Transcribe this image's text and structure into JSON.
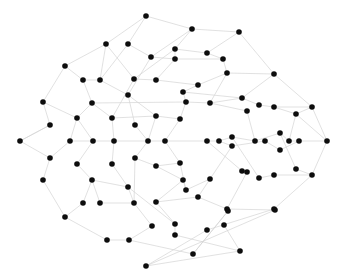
{
  "diagram": {
    "type": "network-graph",
    "node_color": "#0d0d0d",
    "edge_color": "#d4d4d4",
    "node_radius": 2.8,
    "nodes": [
      [
        146,
        16
      ],
      [
        192,
        29
      ],
      [
        239,
        32
      ],
      [
        106,
        44
      ],
      [
        128,
        44
      ],
      [
        175,
        49
      ],
      [
        207,
        53
      ],
      [
        151,
        57
      ],
      [
        175,
        59
      ],
      [
        223,
        59
      ],
      [
        65,
        66
      ],
      [
        227,
        73
      ],
      [
        274,
        74
      ],
      [
        83,
        80
      ],
      [
        100,
        80
      ],
      [
        134,
        79
      ],
      [
        156,
        80
      ],
      [
        198,
        85
      ],
      [
        183,
        92
      ],
      [
        128,
        95
      ],
      [
        43,
        102
      ],
      [
        92,
        103
      ],
      [
        186,
        102
      ],
      [
        210,
        103
      ],
      [
        242,
        98
      ],
      [
        259,
        105
      ],
      [
        274,
        107
      ],
      [
        312,
        107
      ],
      [
        247,
        111
      ],
      [
        296,
        114
      ],
      [
        77,
        118
      ],
      [
        112,
        118
      ],
      [
        156,
        116
      ],
      [
        180,
        119
      ],
      [
        50,
        125
      ],
      [
        135,
        125
      ],
      [
        20,
        141
      ],
      [
        70,
        141
      ],
      [
        93,
        141
      ],
      [
        114,
        141
      ],
      [
        148,
        141
      ],
      [
        165,
        141
      ],
      [
        207,
        141
      ],
      [
        219,
        141
      ],
      [
        232,
        137
      ],
      [
        232,
        146
      ],
      [
        255,
        141
      ],
      [
        265,
        141
      ],
      [
        280,
        133
      ],
      [
        280,
        150
      ],
      [
        289,
        141
      ],
      [
        299,
        141
      ],
      [
        327,
        141
      ],
      [
        50,
        158
      ],
      [
        77,
        164
      ],
      [
        112,
        164
      ],
      [
        135,
        158
      ],
      [
        156,
        166
      ],
      [
        180,
        163
      ],
      [
        43,
        180
      ],
      [
        92,
        180
      ],
      [
        128,
        187
      ],
      [
        183,
        180
      ],
      [
        186,
        190
      ],
      [
        210,
        179
      ],
      [
        242,
        171
      ],
      [
        247,
        172
      ],
      [
        259,
        178
      ],
      [
        274,
        175
      ],
      [
        296,
        169
      ],
      [
        312,
        175
      ],
      [
        83,
        203
      ],
      [
        100,
        203
      ],
      [
        134,
        203
      ],
      [
        156,
        202
      ],
      [
        198,
        197
      ],
      [
        227,
        209
      ],
      [
        274,
        209
      ],
      [
        65,
        217
      ],
      [
        152,
        226
      ],
      [
        175,
        224
      ],
      [
        224,
        225
      ],
      [
        207,
        230
      ],
      [
        107,
        240
      ],
      [
        129,
        240
      ],
      [
        175,
        235
      ],
      [
        193,
        254
      ],
      [
        240,
        251
      ],
      [
        146,
        266
      ],
      [
        228,
        211
      ],
      [
        275,
        210
      ]
    ],
    "edges": [
      [
        0,
        3
      ],
      [
        0,
        1
      ],
      [
        0,
        4
      ],
      [
        1,
        2
      ],
      [
        1,
        5
      ],
      [
        1,
        7
      ],
      [
        2,
        6
      ],
      [
        2,
        12
      ],
      [
        3,
        10
      ],
      [
        3,
        15
      ],
      [
        4,
        7
      ],
      [
        4,
        14
      ],
      [
        5,
        8
      ],
      [
        5,
        6
      ],
      [
        6,
        9
      ],
      [
        7,
        8
      ],
      [
        7,
        19
      ],
      [
        8,
        9
      ],
      [
        8,
        16
      ],
      [
        9,
        11
      ],
      [
        10,
        13
      ],
      [
        10,
        20
      ],
      [
        11,
        12
      ],
      [
        11,
        17
      ],
      [
        12,
        24
      ],
      [
        12,
        27
      ],
      [
        13,
        14
      ],
      [
        13,
        21
      ],
      [
        14,
        19
      ],
      [
        15,
        16
      ],
      [
        15,
        31
      ],
      [
        16,
        17
      ],
      [
        17,
        18
      ],
      [
        18,
        22
      ],
      [
        19,
        32
      ],
      [
        20,
        34
      ],
      [
        20,
        30
      ],
      [
        21,
        30
      ],
      [
        21,
        31
      ],
      [
        22,
        23
      ],
      [
        23,
        24
      ],
      [
        23,
        28
      ],
      [
        24,
        25
      ],
      [
        25,
        26
      ],
      [
        26,
        27
      ],
      [
        26,
        29
      ],
      [
        27,
        29
      ],
      [
        28,
        46
      ],
      [
        29,
        50
      ],
      [
        29,
        52
      ],
      [
        30,
        37
      ],
      [
        30,
        38
      ],
      [
        31,
        39
      ],
      [
        32,
        33
      ],
      [
        32,
        40
      ],
      [
        33,
        41
      ],
      [
        34,
        36
      ],
      [
        35,
        40
      ],
      [
        35,
        19
      ],
      [
        36,
        53
      ],
      [
        36,
        34
      ],
      [
        37,
        38
      ],
      [
        38,
        39
      ],
      [
        39,
        40
      ],
      [
        40,
        41
      ],
      [
        41,
        42
      ],
      [
        42,
        43
      ],
      [
        43,
        44
      ],
      [
        44,
        46
      ],
      [
        43,
        45
      ],
      [
        45,
        47
      ],
      [
        46,
        48
      ],
      [
        47,
        49
      ],
      [
        48,
        50
      ],
      [
        49,
        51
      ],
      [
        50,
        51
      ],
      [
        51,
        52
      ],
      [
        52,
        70
      ],
      [
        52,
        27
      ],
      [
        53,
        59
      ],
      [
        53,
        37
      ],
      [
        54,
        38
      ],
      [
        54,
        60
      ],
      [
        55,
        39
      ],
      [
        55,
        61
      ],
      [
        56,
        40
      ],
      [
        56,
        57
      ],
      [
        57,
        62
      ],
      [
        58,
        41
      ],
      [
        58,
        63
      ],
      [
        59,
        78
      ],
      [
        60,
        71
      ],
      [
        60,
        72
      ],
      [
        61,
        73
      ],
      [
        62,
        74
      ],
      [
        63,
        64
      ],
      [
        64,
        75
      ],
      [
        65,
        66
      ],
      [
        66,
        76
      ],
      [
        67,
        68
      ],
      [
        68,
        70
      ],
      [
        69,
        70
      ],
      [
        70,
        77
      ],
      [
        71,
        78
      ],
      [
        72,
        73
      ],
      [
        73,
        79
      ],
      [
        74,
        80
      ],
      [
        75,
        76
      ],
      [
        76,
        90
      ],
      [
        77,
        91
      ],
      [
        78,
        83
      ],
      [
        79,
        84
      ],
      [
        80,
        85
      ],
      [
        81,
        87
      ],
      [
        82,
        88
      ],
      [
        83,
        84
      ],
      [
        84,
        86
      ],
      [
        85,
        87
      ],
      [
        86,
        89
      ],
      [
        87,
        88
      ],
      [
        88,
        90
      ],
      [
        90,
        91
      ],
      [
        89,
        86
      ],
      [
        22,
        33
      ],
      [
        18,
        24
      ],
      [
        42,
        65
      ],
      [
        44,
        67
      ],
      [
        48,
        69
      ],
      [
        45,
        64
      ],
      [
        62,
        63
      ],
      [
        57,
        58
      ],
      [
        11,
        23
      ],
      [
        5,
        15
      ],
      [
        3,
        14
      ],
      [
        21,
        22
      ],
      [
        31,
        32
      ],
      [
        60,
        61
      ],
      [
        74,
        75
      ],
      [
        56,
        73
      ],
      [
        61,
        80
      ],
      [
        82,
        77
      ]
    ]
  }
}
